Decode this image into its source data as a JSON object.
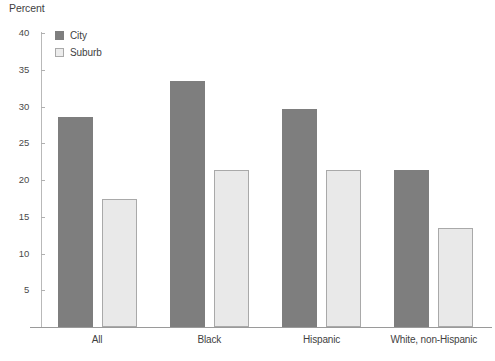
{
  "chart_data": {
    "type": "bar",
    "title": "",
    "subtitle": "",
    "xlabel": "",
    "ylabel": "Percent",
    "ylim": [
      0,
      40
    ],
    "yticks": [
      0,
      5,
      10,
      15,
      20,
      25,
      30,
      35,
      40
    ],
    "ytick_labels": [
      "",
      "5",
      "10",
      "15",
      "20",
      "25",
      "30",
      "35",
      "40"
    ],
    "grid": false,
    "legend_position": "top-left",
    "categories": [
      "All",
      "Black",
      "Hispanic",
      "White, non-Hispanic"
    ],
    "series": [
      {
        "name": "City",
        "color": "#7e7e7e",
        "values": [
          28.6,
          33.5,
          29.6,
          21.4
        ]
      },
      {
        "name": "Suburb",
        "color": "#e9e9e9",
        "values": [
          17.4,
          21.4,
          21.4,
          13.5
        ]
      }
    ]
  },
  "legend": {
    "items": [
      {
        "label": "City",
        "swatch": "city"
      },
      {
        "label": "Suburb",
        "swatch": "suburb"
      }
    ]
  },
  "axis": {
    "y_title": "Percent"
  }
}
